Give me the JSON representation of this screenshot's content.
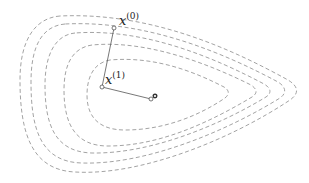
{
  "diagram": {
    "type": "optimization-contour-plot",
    "contour_style": "dashed",
    "contour_color": "#8c8c8c",
    "contour_count": 5,
    "iterates": [
      {
        "label": "x",
        "superscript": "(0)",
        "x": 114,
        "y": 28
      },
      {
        "label": "x",
        "superscript": "(1)",
        "x": 102,
        "y": 87
      },
      {
        "label": "",
        "superscript": "",
        "x": 151,
        "y": 99
      }
    ],
    "minimum": {
      "x": 156,
      "y": 96
    },
    "labels": {
      "x0_base": "x",
      "x0_sup": "(0)",
      "x1_base": "x",
      "x1_sup": "(1)"
    }
  }
}
